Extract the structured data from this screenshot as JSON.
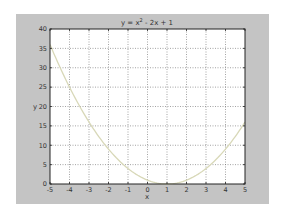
{
  "chart_data": {
    "type": "line",
    "title_parts": {
      "base": "y = x",
      "sup": "2",
      "rest": " - 2x + 1"
    },
    "xlabel": "x",
    "ylabel": "y",
    "xlim": [
      -5,
      5
    ],
    "ylim": [
      0,
      40
    ],
    "xticks": [
      -5,
      -4,
      -3,
      -2,
      -1,
      0,
      1,
      2,
      3,
      4,
      5
    ],
    "yticks": [
      0,
      5,
      10,
      15,
      20,
      25,
      30,
      35,
      40
    ],
    "grid": true,
    "legend": null,
    "series": [
      {
        "name": "y = x^2 - 2x + 1",
        "color": "#d8d8b8",
        "x": [
          -5,
          -4.5,
          -4,
          -3.5,
          -3,
          -2.5,
          -2,
          -1.5,
          -1,
          -0.5,
          0,
          0.5,
          1,
          1.5,
          2,
          2.5,
          3,
          3.5,
          4,
          4.5,
          5
        ],
        "y": [
          36,
          30.25,
          25,
          20.25,
          16,
          12.25,
          9,
          6.25,
          4,
          2.25,
          1,
          0.25,
          0,
          0.25,
          1,
          2.25,
          4,
          6.25,
          9,
          12.25,
          16
        ]
      }
    ]
  },
  "colors": {
    "figure_bg": "#c4c4c4",
    "axes_bg": "#ffffff",
    "grid": "#555555",
    "axis": "#222222",
    "text": "#333333"
  }
}
